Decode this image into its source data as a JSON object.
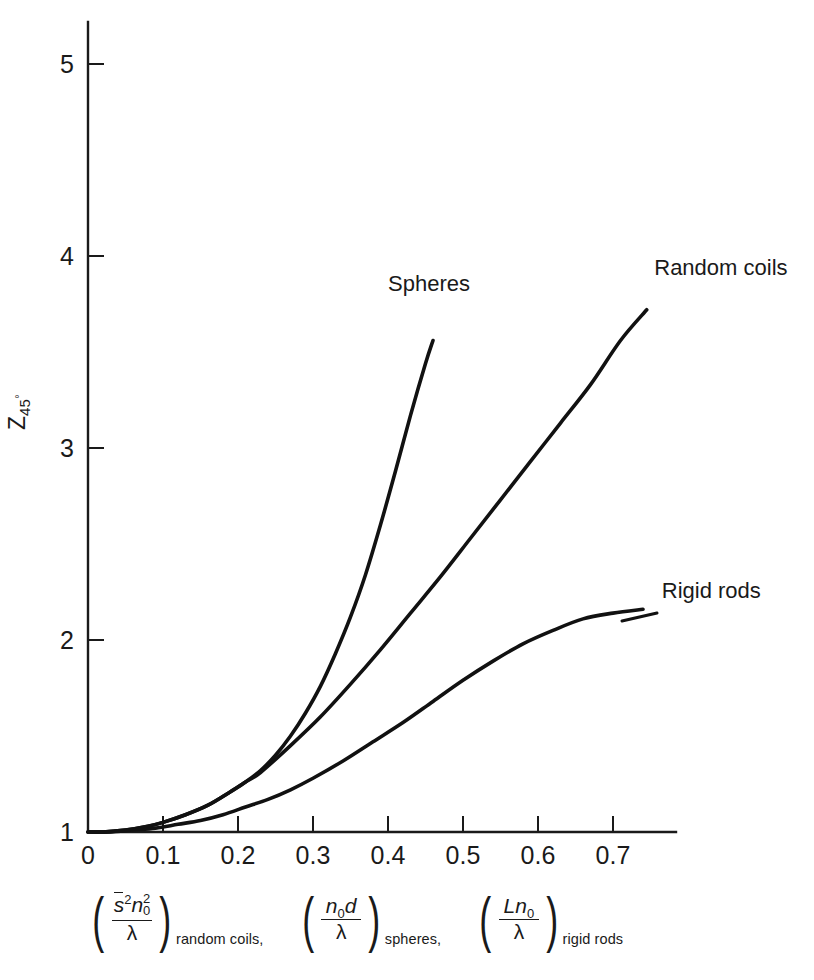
{
  "chart_data": {
    "type": "line",
    "title": "",
    "xlabel": "(s̄²n₀²/λ) random coils, (n₀d/λ) spheres, (Ln₀/λ) rigid rods",
    "ylabel": "Z45°",
    "xlim": [
      0,
      0.772
    ],
    "ylim": [
      1,
      5.3
    ],
    "grid": false,
    "legend_position": "inline-curve-labels",
    "xticks": [
      "0",
      "0.1",
      "0.2",
      "0.3",
      "0.4",
      "0.5",
      "0.6",
      "0.7"
    ],
    "xtick_values": [
      0,
      0.1,
      0.2,
      0.3,
      0.4,
      0.5,
      0.6,
      0.7
    ],
    "yticks": [
      "1",
      "2",
      "3",
      "4",
      "5"
    ],
    "ytick_values": [
      1,
      2,
      3,
      4,
      5
    ],
    "series": [
      {
        "name": "Spheres",
        "x": [
          0,
          0.02,
          0.05,
          0.08,
          0.1,
          0.13,
          0.16,
          0.19,
          0.21,
          0.23,
          0.25,
          0.27,
          0.29,
          0.31,
          0.33,
          0.35,
          0.37,
          0.39,
          0.41,
          0.43,
          0.45,
          0.46
        ],
        "y": [
          1.0,
          1.0,
          1.01,
          1.03,
          1.05,
          1.09,
          1.14,
          1.21,
          1.26,
          1.32,
          1.4,
          1.5,
          1.62,
          1.76,
          1.93,
          2.12,
          2.34,
          2.6,
          2.88,
          3.17,
          3.44,
          3.56
        ]
      },
      {
        "name": "Random coils",
        "x": [
          0,
          0.02,
          0.05,
          0.08,
          0.1,
          0.13,
          0.16,
          0.19,
          0.21,
          0.23,
          0.27,
          0.31,
          0.35,
          0.39,
          0.43,
          0.47,
          0.51,
          0.55,
          0.59,
          0.63,
          0.67,
          0.71,
          0.745
        ],
        "y": [
          1.0,
          1.0,
          1.01,
          1.03,
          1.05,
          1.09,
          1.14,
          1.21,
          1.26,
          1.31,
          1.45,
          1.6,
          1.77,
          1.95,
          2.14,
          2.33,
          2.53,
          2.73,
          2.93,
          3.13,
          3.33,
          3.56,
          3.72
        ]
      },
      {
        "name": "Rigid rods",
        "x": [
          0,
          0.03,
          0.06,
          0.09,
          0.12,
          0.15,
          0.18,
          0.21,
          0.24,
          0.27,
          0.3,
          0.34,
          0.38,
          0.42,
          0.46,
          0.5,
          0.54,
          0.58,
          0.62,
          0.66,
          0.7,
          0.74
        ],
        "y": [
          1.0,
          1.0,
          1.01,
          1.02,
          1.04,
          1.06,
          1.09,
          1.13,
          1.17,
          1.22,
          1.28,
          1.37,
          1.47,
          1.57,
          1.68,
          1.79,
          1.89,
          1.98,
          2.05,
          2.11,
          2.14,
          2.16
        ]
      }
    ],
    "annotations": [
      {
        "text": "Spheres",
        "x": 0.4,
        "y": 3.82
      },
      {
        "text": "Random coils",
        "x": 0.755,
        "y": 3.9
      },
      {
        "text": "Rigid rods",
        "x": 0.765,
        "y": 2.22
      }
    ]
  },
  "axis_titles": {
    "y": {
      "symbol": "Z",
      "subscript": "45",
      "degree": "°"
    },
    "x_terms": [
      {
        "numerator_parts": [
          {
            "text": "s",
            "style": "overbar-italic"
          },
          {
            "text": "2",
            "style": "exponent"
          },
          {
            "text": "n",
            "style": "italic"
          },
          {
            "text": "2",
            "style": "exponent-stacked"
          },
          {
            "text": "0",
            "style": "index-stacked"
          }
        ],
        "numerator_plain": "s̄²n₀²",
        "denominator": "λ",
        "subscript": "random coils,"
      },
      {
        "numerator_plain": "n₀d",
        "denominator": "λ",
        "subscript": "spheres,"
      },
      {
        "numerator_plain": "Ln₀",
        "denominator": "λ",
        "subscript": "rigid rods"
      }
    ]
  },
  "colors": {
    "background": "#ffffff",
    "ink": "#1a1a1a",
    "curve": "#111111"
  }
}
